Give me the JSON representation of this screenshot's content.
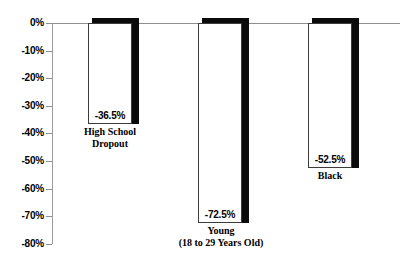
{
  "chart_data": {
    "type": "bar",
    "title": "",
    "subtitle": "",
    "xlabel": "",
    "ylabel": "",
    "orientation": "vertical",
    "grid": false,
    "legend": false,
    "ylim": [
      -80,
      0
    ],
    "ytick_step": 10,
    "ytick_labels": [
      "0%",
      "-10%",
      "-20%",
      "-30%",
      "-40%",
      "-50%",
      "-60%",
      "-70%",
      "-80%"
    ],
    "ytick_values": [
      0,
      -10,
      -20,
      -30,
      -40,
      -50,
      -60,
      -70,
      -80
    ],
    "categories": [
      "High School Dropout",
      "Young (18 to 29 Years Old)",
      "Black"
    ],
    "values": [
      -36.5,
      -72.5,
      -52.5
    ],
    "value_labels": [
      "-36.5%",
      "-72.5%",
      "-52.5%"
    ],
    "bars": [
      {
        "category_line1": "High School",
        "category_line2": "Dropout",
        "value": -36.5,
        "value_label": "-36.5%"
      },
      {
        "category_line1": "Young",
        "category_line2": "(18 to 29 Years Old)",
        "value": -72.5,
        "value_label": "-72.5%"
      },
      {
        "category_line1": "Black",
        "category_line2": "",
        "value": -52.5,
        "value_label": "-52.5%"
      }
    ]
  },
  "colors": {
    "bar_face": "#ffffff",
    "bar_shadow": "#0b0b0b",
    "bar_outline": "#3c3c3c",
    "axis_line": "#8f8f8f",
    "text": "#000000",
    "background": "#ffffff"
  }
}
